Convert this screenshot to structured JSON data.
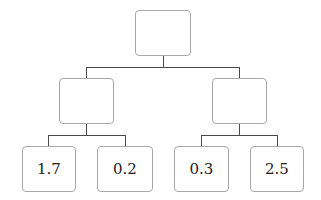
{
  "diagram": {
    "type": "tree",
    "root": {
      "label": ""
    },
    "level1": [
      {
        "label": ""
      },
      {
        "label": ""
      }
    ],
    "leaves": [
      {
        "label": "1.7"
      },
      {
        "label": "0.2"
      },
      {
        "label": "0.3"
      },
      {
        "label": "2.5"
      }
    ]
  }
}
